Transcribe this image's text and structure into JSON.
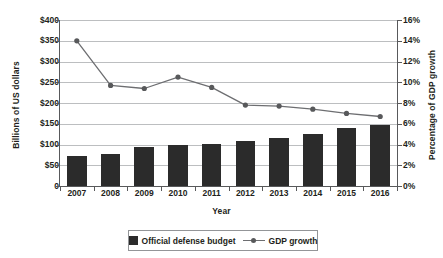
{
  "chart_data": {
    "type": "bar",
    "title": "",
    "xlabel": "Year",
    "categories": [
      "2007",
      "2008",
      "2009",
      "2010",
      "2011",
      "2012",
      "2013",
      "2014",
      "2015",
      "2016"
    ],
    "grid": true,
    "legend_position": "bottom",
    "axes": {
      "left": {
        "label": "Billions of US dollars",
        "ticks": [
          "0",
          "$50",
          "$100",
          "$150",
          "$200",
          "$250",
          "$300",
          "$350",
          "$400"
        ],
        "tick_values": [
          0,
          50,
          100,
          150,
          200,
          250,
          300,
          350,
          400
        ],
        "min": 0,
        "max": 400
      },
      "right": {
        "label": "Percentage of GDP growth",
        "ticks": [
          "0%",
          "2%",
          "4%",
          "6%",
          "8%",
          "10%",
          "12%",
          "14%",
          "16%"
        ],
        "tick_values": [
          0,
          2,
          4,
          6,
          8,
          10,
          12,
          14,
          16
        ],
        "min": 0,
        "max": 16
      }
    },
    "series": [
      {
        "name": "Official defense budget",
        "type": "bar",
        "axis": "left",
        "color": "#2b2b2b",
        "values": [
          72,
          78,
          93,
          98,
          101,
          109,
          116,
          126,
          140,
          148
        ]
      },
      {
        "name": "GDP growth",
        "type": "line",
        "axis": "right",
        "color": "#6d6e71",
        "marker": "circle",
        "values": [
          14.0,
          9.7,
          9.4,
          10.5,
          9.5,
          7.8,
          7.7,
          7.4,
          7.0,
          6.7
        ]
      }
    ]
  },
  "legend": {
    "items": [
      {
        "label": "Official defense budget",
        "marker": "square-swatch"
      },
      {
        "label": "GDP growth",
        "marker": "line-with-dot"
      }
    ]
  }
}
